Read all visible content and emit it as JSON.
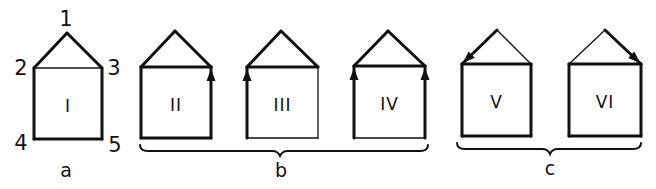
{
  "figure": {
    "stroke_color": "#111111",
    "background": "#ffffff",
    "vertex_labels": [
      {
        "text": "1",
        "x": 66,
        "y": 19
      },
      {
        "text": "2",
        "x": 21,
        "y": 68
      },
      {
        "text": "3",
        "x": 114,
        "y": 68
      },
      {
        "text": "4",
        "x": 21,
        "y": 143
      },
      {
        "text": "5",
        "x": 115,
        "y": 145
      }
    ],
    "houses": [
      {
        "id": "I",
        "label": "I",
        "group": "a",
        "apex": [
          67,
          33
        ],
        "left": 34,
        "right": 102,
        "top": 68,
        "bottom": 139,
        "thick": [
          "roofL",
          "roofR",
          "left",
          "right",
          "bottom"
        ],
        "thin": [
          "top"
        ],
        "arrows": []
      },
      {
        "id": "II",
        "label": "II",
        "group": "b",
        "apex": [
          175,
          31
        ],
        "left": 141,
        "right": 211,
        "top": 67,
        "bottom": 138,
        "thick": [
          "roofL",
          "roofR",
          "top",
          "left",
          "right",
          "bottom"
        ],
        "thin": [],
        "arrows": [
          "right-up"
        ]
      },
      {
        "id": "III",
        "label": "III",
        "group": "b",
        "apex": [
          281,
          31
        ],
        "left": 247,
        "right": 318,
        "top": 67,
        "bottom": 138,
        "thick": [
          "roofL",
          "roofR",
          "top",
          "left"
        ],
        "thin": [
          "right",
          "bottom"
        ],
        "arrows": [
          "left-up"
        ]
      },
      {
        "id": "IV",
        "label": "IV",
        "group": "b",
        "apex": [
          388,
          31
        ],
        "left": 354,
        "right": 425,
        "top": 66,
        "bottom": 138,
        "thick": [
          "roofL",
          "roofR",
          "top",
          "left",
          "right"
        ],
        "thin": [
          "bottom"
        ],
        "arrows": [
          "left-up",
          "right-up"
        ]
      },
      {
        "id": "V",
        "label": "V",
        "group": "c",
        "apex": [
          497,
          30
        ],
        "left": 462,
        "right": 531,
        "top": 64,
        "bottom": 136,
        "thick": [
          "roofL",
          "top",
          "left",
          "right",
          "bottom"
        ],
        "thin": [
          "roofR"
        ],
        "arrows": [
          "roofL-down"
        ]
      },
      {
        "id": "VI",
        "label": "VI",
        "group": "c",
        "apex": [
          605,
          30
        ],
        "left": 569,
        "right": 641,
        "top": 64,
        "bottom": 136,
        "thick": [
          "roofR",
          "top",
          "left",
          "right",
          "bottom"
        ],
        "thin": [
          "roofL"
        ],
        "arrows": [
          "roofR-down"
        ]
      }
    ],
    "groups": [
      {
        "id": "a",
        "label": "a",
        "label_x": 66,
        "label_y": 170,
        "brace": null
      },
      {
        "id": "b",
        "label": "b",
        "label_x": 281,
        "label_y": 170,
        "brace": {
          "x1": 140,
          "x2": 428,
          "y": 151,
          "mid": 280
        }
      },
      {
        "id": "c",
        "label": "c",
        "label_x": 550,
        "label_y": 168,
        "brace": {
          "x1": 457,
          "x2": 641,
          "y": 149,
          "mid": 550
        }
      }
    ]
  }
}
